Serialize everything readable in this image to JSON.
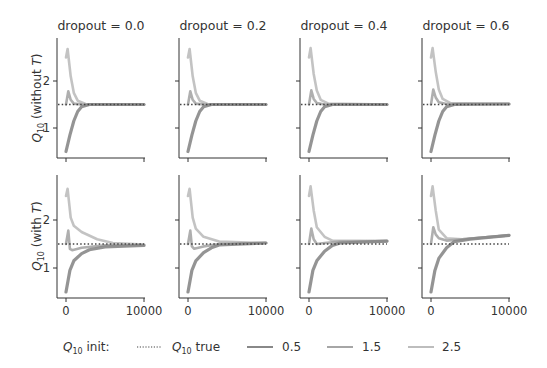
{
  "chart_data": {
    "type": "line",
    "layout": {
      "rows": 2,
      "cols": 4,
      "grid": false,
      "legend_position": "bottom"
    },
    "column_titles": [
      "dropout = 0.0",
      "dropout = 0.2",
      "dropout = 0.4",
      "dropout = 0.6"
    ],
    "row_ylabels": [
      {
        "main": "Q",
        "sub": "10",
        "rest": " (without ",
        "italic": "T",
        "end": ")"
      },
      {
        "main": "Q",
        "sub": "10",
        "rest": " (with ",
        "italic": "T",
        "end": ")"
      }
    ],
    "xlim": [
      0,
      10000
    ],
    "ylim": [
      0.4,
      2.85
    ],
    "xticks": [
      0,
      10000
    ],
    "xtick_labels": [
      "0",
      "10000"
    ],
    "yticks": [
      1,
      2
    ],
    "ytick_labels": [
      "1",
      "2"
    ],
    "true_value": 1.5,
    "legend": {
      "title_main": "Q",
      "title_sub": "10",
      "title_rest": " init:",
      "entries": [
        {
          "label_main": "Q",
          "label_sub": "10",
          "label_rest": " true",
          "style": "dotted",
          "color": "#444444"
        },
        {
          "label": "0.5",
          "style": "solid",
          "color": "#888888"
        },
        {
          "label": "1.5",
          "style": "solid",
          "color": "#a6a6a6"
        },
        {
          "label": "2.5",
          "style": "solid",
          "color": "#bdbdbd"
        }
      ]
    },
    "colors": {
      "init_0.5": "#888888",
      "init_1.5": "#a6a6a6",
      "init_2.5": "#bdbdbd",
      "true": "#444444",
      "axis": "#333333"
    },
    "panels": [
      {
        "row": 0,
        "col": 0,
        "series": {
          "0.5": [
            [
              0,
              0.5
            ],
            [
              500,
              0.85
            ],
            [
              1000,
              1.15
            ],
            [
              1500,
              1.35
            ],
            [
              2000,
              1.45
            ],
            [
              3000,
              1.5
            ],
            [
              10000,
              1.5
            ]
          ],
          "1.5": [
            [
              0,
              1.5
            ],
            [
              300,
              1.78
            ],
            [
              600,
              1.6
            ],
            [
              1000,
              1.52
            ],
            [
              2000,
              1.5
            ],
            [
              10000,
              1.5
            ]
          ],
          "2.5": [
            [
              0,
              2.5
            ],
            [
              200,
              2.68
            ],
            [
              600,
              2.1
            ],
            [
              1000,
              1.75
            ],
            [
              1500,
              1.58
            ],
            [
              2500,
              1.51
            ],
            [
              10000,
              1.5
            ]
          ]
        }
      },
      {
        "row": 0,
        "col": 1,
        "series": {
          "0.5": [
            [
              0,
              0.5
            ],
            [
              500,
              0.85
            ],
            [
              1000,
              1.15
            ],
            [
              1500,
              1.35
            ],
            [
              2000,
              1.45
            ],
            [
              3000,
              1.5
            ],
            [
              10000,
              1.5
            ]
          ],
          "1.5": [
            [
              0,
              1.5
            ],
            [
              300,
              1.78
            ],
            [
              600,
              1.6
            ],
            [
              1000,
              1.52
            ],
            [
              2000,
              1.5
            ],
            [
              10000,
              1.5
            ]
          ],
          "2.5": [
            [
              0,
              2.5
            ],
            [
              200,
              2.68
            ],
            [
              600,
              2.1
            ],
            [
              1000,
              1.75
            ],
            [
              1500,
              1.58
            ],
            [
              2500,
              1.51
            ],
            [
              10000,
              1.5
            ]
          ]
        }
      },
      {
        "row": 0,
        "col": 2,
        "series": {
          "0.5": [
            [
              0,
              0.5
            ],
            [
              500,
              0.85
            ],
            [
              1000,
              1.15
            ],
            [
              1500,
              1.35
            ],
            [
              2000,
              1.45
            ],
            [
              3000,
              1.5
            ],
            [
              10000,
              1.5
            ]
          ],
          "1.5": [
            [
              0,
              1.5
            ],
            [
              300,
              1.8
            ],
            [
              600,
              1.62
            ],
            [
              1000,
              1.53
            ],
            [
              2000,
              1.5
            ],
            [
              10000,
              1.5
            ]
          ],
          "2.5": [
            [
              0,
              2.5
            ],
            [
              200,
              2.7
            ],
            [
              600,
              2.15
            ],
            [
              1000,
              1.8
            ],
            [
              1500,
              1.6
            ],
            [
              2500,
              1.52
            ],
            [
              10000,
              1.5
            ]
          ]
        }
      },
      {
        "row": 0,
        "col": 3,
        "series": {
          "0.5": [
            [
              0,
              0.5
            ],
            [
              500,
              0.85
            ],
            [
              1000,
              1.15
            ],
            [
              1500,
              1.35
            ],
            [
              2000,
              1.45
            ],
            [
              3000,
              1.5
            ],
            [
              10000,
              1.51
            ]
          ],
          "1.5": [
            [
              0,
              1.5
            ],
            [
              300,
              1.82
            ],
            [
              600,
              1.65
            ],
            [
              1000,
              1.55
            ],
            [
              2000,
              1.51
            ],
            [
              10000,
              1.51
            ]
          ],
          "2.5": [
            [
              0,
              2.5
            ],
            [
              200,
              2.7
            ],
            [
              600,
              2.2
            ],
            [
              1000,
              1.82
            ],
            [
              1500,
              1.62
            ],
            [
              2500,
              1.53
            ],
            [
              10000,
              1.51
            ]
          ]
        }
      },
      {
        "row": 1,
        "col": 0,
        "series": {
          "0.5": [
            [
              0,
              0.5
            ],
            [
              500,
              0.95
            ],
            [
              1000,
              1.15
            ],
            [
              2000,
              1.3
            ],
            [
              3000,
              1.38
            ],
            [
              5000,
              1.44
            ],
            [
              10000,
              1.47
            ]
          ],
          "1.5": [
            [
              0,
              1.5
            ],
            [
              300,
              1.78
            ],
            [
              500,
              1.4
            ],
            [
              800,
              1.37
            ],
            [
              2000,
              1.42
            ],
            [
              5000,
              1.47
            ],
            [
              10000,
              1.48
            ]
          ],
          "2.5": [
            [
              0,
              2.5
            ],
            [
              200,
              2.65
            ],
            [
              600,
              2.05
            ],
            [
              1000,
              1.88
            ],
            [
              2000,
              1.75
            ],
            [
              4000,
              1.6
            ],
            [
              6000,
              1.52
            ],
            [
              10000,
              1.49
            ]
          ]
        }
      },
      {
        "row": 1,
        "col": 1,
        "series": {
          "0.5": [
            [
              0,
              0.5
            ],
            [
              500,
              0.95
            ],
            [
              1000,
              1.15
            ],
            [
              2000,
              1.32
            ],
            [
              3000,
              1.42
            ],
            [
              4000,
              1.48
            ],
            [
              10000,
              1.52
            ]
          ],
          "1.5": [
            [
              0,
              1.5
            ],
            [
              300,
              1.78
            ],
            [
              500,
              1.45
            ],
            [
              800,
              1.4
            ],
            [
              2000,
              1.45
            ],
            [
              4000,
              1.5
            ],
            [
              10000,
              1.52
            ]
          ],
          "2.5": [
            [
              0,
              2.5
            ],
            [
              200,
              2.65
            ],
            [
              600,
              2.05
            ],
            [
              1000,
              1.82
            ],
            [
              2000,
              1.65
            ],
            [
              4000,
              1.55
            ],
            [
              10000,
              1.52
            ]
          ]
        }
      },
      {
        "row": 1,
        "col": 2,
        "series": {
          "0.5": [
            [
              0,
              0.5
            ],
            [
              500,
              0.95
            ],
            [
              1000,
              1.15
            ],
            [
              2000,
              1.35
            ],
            [
              3000,
              1.47
            ],
            [
              4000,
              1.52
            ],
            [
              10000,
              1.56
            ]
          ],
          "1.5": [
            [
              0,
              1.5
            ],
            [
              300,
              1.82
            ],
            [
              600,
              1.6
            ],
            [
              1000,
              1.5
            ],
            [
              2000,
              1.52
            ],
            [
              4000,
              1.55
            ],
            [
              10000,
              1.56
            ]
          ],
          "2.5": [
            [
              0,
              2.5
            ],
            [
              200,
              2.7
            ],
            [
              600,
              2.2
            ],
            [
              1000,
              1.85
            ],
            [
              2000,
              1.65
            ],
            [
              3000,
              1.57
            ],
            [
              10000,
              1.56
            ]
          ]
        }
      },
      {
        "row": 1,
        "col": 3,
        "series": {
          "0.5": [
            [
              0,
              0.5
            ],
            [
              500,
              0.95
            ],
            [
              1000,
              1.2
            ],
            [
              2000,
              1.42
            ],
            [
              3000,
              1.55
            ],
            [
              5000,
              1.6
            ],
            [
              10000,
              1.68
            ]
          ],
          "1.5": [
            [
              0,
              1.5
            ],
            [
              300,
              1.85
            ],
            [
              600,
              1.7
            ],
            [
              1000,
              1.62
            ],
            [
              2000,
              1.57
            ],
            [
              4000,
              1.6
            ],
            [
              10000,
              1.68
            ]
          ],
          "2.5": [
            [
              0,
              2.5
            ],
            [
              200,
              2.7
            ],
            [
              600,
              2.2
            ],
            [
              1000,
              1.8
            ],
            [
              2000,
              1.62
            ],
            [
              4000,
              1.6
            ],
            [
              10000,
              1.68
            ]
          ]
        }
      }
    ]
  }
}
